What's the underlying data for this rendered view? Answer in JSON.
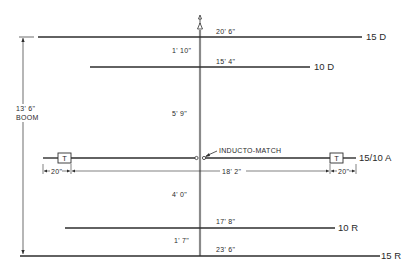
{
  "diagram": {
    "title": "",
    "colors": {
      "line": "#2e2e2e",
      "mast": "#8a8a8a",
      "text": "#2a2a2a",
      "background": "#ffffff"
    },
    "boom": {
      "length_label": "13' 6\"",
      "name_label": "BOOM"
    },
    "elements": [
      {
        "id": "15D",
        "label": "15 D",
        "length": "20' 6\""
      },
      {
        "id": "10D",
        "label": "10 D",
        "length": "15' 4\""
      },
      {
        "id": "15_10A",
        "label": "15/10 A",
        "length": "18' 2\""
      },
      {
        "id": "10R",
        "label": "10 R",
        "length": "17' 8\""
      },
      {
        "id": "15R",
        "label": "15 R",
        "length": "23' 6\""
      }
    ],
    "spacings": [
      {
        "between": "15D-10D",
        "value": "1' 10\""
      },
      {
        "between": "10D-15/10A",
        "value": "5' 9\""
      },
      {
        "between": "15/10A-10R",
        "value": "4' 0\""
      },
      {
        "between": "10R-15R",
        "value": "1' 7\""
      }
    ],
    "traps": {
      "symbol": "T",
      "left_tip_length": "20\"",
      "right_tip_length": "20\""
    },
    "feed": {
      "label": "INDUCTO-MATCH"
    },
    "icons": {
      "mast_top": "antenna-mast-icon",
      "trap": "trap-box-icon"
    }
  }
}
